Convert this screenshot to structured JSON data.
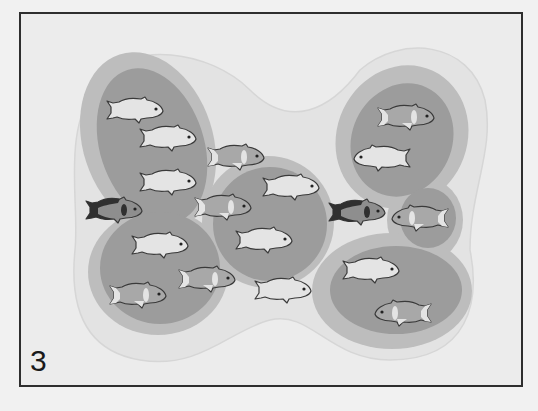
{
  "panel": {
    "label": "3",
    "frame": {
      "x": 20,
      "y": 13,
      "w": 502,
      "h": 373
    },
    "colors": {
      "background": "#ececec",
      "frame": "#2e2e2e",
      "halo": "#e2e2e2",
      "halo_stroke": "#d6d6d6",
      "outer_zone": "#bdbdbd",
      "inner_zone": "#9c9c9c",
      "fish_light": "#e4e4e4",
      "fish_band": "#a8a8a8",
      "fish_dark": "#303030",
      "fish_outline": "#3a3a3a"
    }
  },
  "zones": [
    {
      "name": "territory-left-top",
      "outer": {
        "cx": 148,
        "cy": 142,
        "rx": 65,
        "ry": 92,
        "rot": -18
      },
      "inner": {
        "cx": 152,
        "cy": 146,
        "rx": 52,
        "ry": 80,
        "rot": -18
      }
    },
    {
      "name": "territory-left-bottom",
      "outer": {
        "cx": 158,
        "cy": 272,
        "rx": 70,
        "ry": 63,
        "rot": 0
      },
      "inner": {
        "cx": 160,
        "cy": 268,
        "rx": 60,
        "ry": 56,
        "rot": 0
      }
    },
    {
      "name": "territory-center",
      "outer": {
        "cx": 268,
        "cy": 222,
        "rx": 66,
        "ry": 66,
        "rot": 0
      },
      "inner": {
        "cx": 270,
        "cy": 224,
        "rx": 57,
        "ry": 57,
        "rot": 0
      }
    },
    {
      "name": "territory-right-top",
      "outer": {
        "cx": 402,
        "cy": 137,
        "rx": 65,
        "ry": 73,
        "rot": 25
      },
      "inner": {
        "cx": 402,
        "cy": 140,
        "rx": 50,
        "ry": 58,
        "rot": 25
      }
    },
    {
      "name": "territory-right-small",
      "outer": {
        "cx": 425,
        "cy": 220,
        "rx": 38,
        "ry": 42,
        "rot": 0
      },
      "inner": {
        "cx": 428,
        "cy": 218,
        "rx": 28,
        "ry": 30,
        "rot": 0
      }
    },
    {
      "name": "territory-right-bottom",
      "outer": {
        "cx": 392,
        "cy": 291,
        "rx": 80,
        "ry": 58,
        "rot": 0
      },
      "inner": {
        "cx": 396,
        "cy": 290,
        "rx": 66,
        "ry": 44,
        "rot": 0
      }
    }
  ],
  "fish": [
    {
      "x": 135,
      "y": 110,
      "dir": 1,
      "type": "plain"
    },
    {
      "x": 168,
      "y": 138,
      "dir": 1,
      "type": "plain"
    },
    {
      "x": 168,
      "y": 182,
      "dir": 1,
      "type": "plain"
    },
    {
      "x": 236,
      "y": 157,
      "dir": 1,
      "type": "banded"
    },
    {
      "x": 114,
      "y": 210,
      "dir": 1,
      "type": "dark"
    },
    {
      "x": 223,
      "y": 207,
      "dir": 1,
      "type": "banded"
    },
    {
      "x": 291,
      "y": 187,
      "dir": 1,
      "type": "plain"
    },
    {
      "x": 264,
      "y": 240,
      "dir": 1,
      "type": "plain"
    },
    {
      "x": 160,
      "y": 245,
      "dir": 1,
      "type": "plain"
    },
    {
      "x": 207,
      "y": 279,
      "dir": 1,
      "type": "banded"
    },
    {
      "x": 138,
      "y": 295,
      "dir": 1,
      "type": "banded"
    },
    {
      "x": 283,
      "y": 290,
      "dir": 1,
      "type": "plain"
    },
    {
      "x": 357,
      "y": 212,
      "dir": 1,
      "type": "dark"
    },
    {
      "x": 406,
      "y": 117,
      "dir": 1,
      "type": "banded"
    },
    {
      "x": 382,
      "y": 158,
      "dir": -1,
      "type": "plain"
    },
    {
      "x": 420,
      "y": 218,
      "dir": -1,
      "type": "banded"
    },
    {
      "x": 371,
      "y": 270,
      "dir": 1,
      "type": "plain"
    },
    {
      "x": 403,
      "y": 313,
      "dir": -1,
      "type": "banded"
    }
  ]
}
